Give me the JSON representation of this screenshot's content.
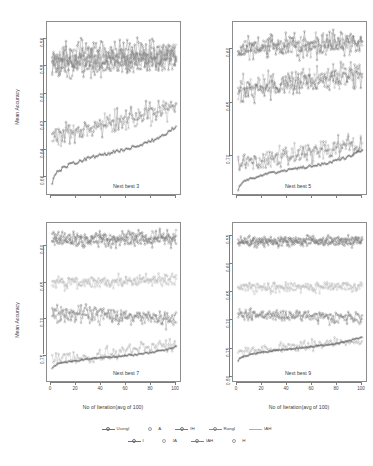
{
  "figure": {
    "y_axis_title": "Mean Accuracy",
    "x_axis_title": "No of Iteration(avg of 100)",
    "background": "#ffffff"
  },
  "panels": [
    {
      "id": "next-best-3",
      "title": "Next best 3",
      "yticks": [
        "0.66",
        "0.64",
        "0.62",
        "0.60",
        "0.58",
        "0.56"
      ],
      "xticks": [],
      "ylim": [
        0.548,
        0.672
      ],
      "xlim": [
        0,
        100
      ]
    },
    {
      "id": "next-best-5",
      "title": "Next best 5",
      "yticks": [
        "0.70",
        "0.65",
        "0.60"
      ],
      "xticks": [],
      "ylim": [
        0.565,
        0.725
      ],
      "xlim": [
        0,
        100
      ]
    },
    {
      "id": "next-best-7",
      "title": "Next best 7",
      "yticks": [
        "0.75",
        "0.70",
        "0.65",
        "0.60"
      ],
      "xticks": [
        "0",
        "20",
        "40",
        "60",
        "80",
        "100"
      ],
      "ylim": [
        0.565,
        0.782
      ],
      "xlim": [
        0,
        100
      ]
    },
    {
      "id": "next-best-9",
      "title": "Next best 9",
      "yticks": [
        "0.80",
        "0.75",
        "0.70",
        "0.65",
        "0.60",
        "0.55"
      ],
      "xticks": [
        "0",
        "20",
        "40",
        "60",
        "80",
        "100"
      ],
      "ylim": [
        0.543,
        0.822
      ],
      "xlim": [
        0,
        100
      ]
    }
  ],
  "legend": {
    "rows": [
      [
        {
          "label": "Usergl",
          "color": "#6f6f6f",
          "marker": "circle",
          "line": true
        },
        {
          "label": "A",
          "color": "#9a9a9a",
          "marker": "circle",
          "line": false
        },
        {
          "label": "IH",
          "color": "#7a7a7a",
          "marker": "circle",
          "line": true
        },
        {
          "label": "Rangl",
          "color": "#8a8a8a",
          "marker": "circle",
          "line": true
        },
        {
          "label": "IAH",
          "color": "#b0b0b0",
          "marker": "none",
          "line": true
        }
      ],
      [
        {
          "label": "I",
          "color": "#707070",
          "marker": "circle",
          "line": true
        },
        {
          "label": "IA",
          "color": "#a5a5a5",
          "marker": "circle",
          "line": false
        },
        {
          "label": "IAH",
          "color": "#7f7f7f",
          "marker": "circle",
          "line": true
        },
        {
          "label": "H",
          "color": "#9c9c9c",
          "marker": "circle",
          "line": false
        }
      ]
    ]
  },
  "chart_data": {
    "type": "line",
    "title": "",
    "xlabel": "No of Iteration(avg of 100)",
    "ylabel": "Mean Accuracy",
    "grid": false,
    "legend_position": "bottom",
    "panel_layout": "2x2",
    "x": [
      1,
      100
    ],
    "panels": [
      {
        "title": "Next best 3",
        "ylim": [
          0.548,
          0.672
        ],
        "xlim": [
          0,
          100
        ],
        "yticks": [
          0.56,
          0.58,
          0.6,
          0.62,
          0.64,
          0.66
        ],
        "xticks": [
          0,
          20,
          40,
          60,
          80,
          100
        ],
        "series": [
          {
            "name": "Usergl",
            "color": "#6f6f6f",
            "band_mean": 0.65,
            "band_noise": 0.01,
            "trend_start": 0.648,
            "trend_end": 0.652,
            "style": "noisy"
          },
          {
            "name": "A",
            "color": "#9a9a9a",
            "band_mean": 0.646,
            "band_noise": 0.009,
            "trend_start": 0.644,
            "trend_end": 0.649,
            "style": "noisy"
          },
          {
            "name": "IH",
            "color": "#7a7a7a",
            "band_mean": 0.643,
            "band_noise": 0.009,
            "trend_start": 0.641,
            "trend_end": 0.646,
            "style": "noisy"
          },
          {
            "name": "Rangl",
            "color": "#8a8a8a",
            "band_mean": 0.64,
            "band_noise": 0.008,
            "trend_start": 0.638,
            "trend_end": 0.643,
            "style": "noisy"
          },
          {
            "name": "IAH",
            "color": "#b0b0b0",
            "band_mean": 0.648,
            "band_noise": 0.009,
            "trend_start": 0.646,
            "trend_end": 0.65,
            "style": "noisy"
          },
          {
            "name": "I",
            "color": "#707070",
            "band_mean": 0.599,
            "band_noise": 0.008,
            "trend_start": 0.59,
            "trend_end": 0.611,
            "style": "noisy"
          },
          {
            "name": "IA",
            "color": "#a5a5a5",
            "band_mean": 0.598,
            "band_noise": 0.008,
            "trend_start": 0.589,
            "trend_end": 0.61,
            "style": "noisy"
          },
          {
            "name": "IAH2",
            "color": "#7f7f7f",
            "band_mean": 0.645,
            "band_noise": 0.009,
            "trend_start": 0.643,
            "trend_end": 0.648,
            "style": "noisy"
          },
          {
            "name": "H",
            "color": "#6a6a6a",
            "band_mean": 0.575,
            "band_noise": 0.0015,
            "trend_start": 0.556,
            "trend_end": 0.597,
            "style": "monotone"
          }
        ]
      },
      {
        "title": "Next best 5",
        "ylim": [
          0.565,
          0.725
        ],
        "xlim": [
          0,
          100
        ],
        "yticks": [
          0.6,
          0.65,
          0.7
        ],
        "xticks": [
          0,
          20,
          40,
          60,
          80,
          100
        ],
        "series": [
          {
            "name": "Usergl",
            "color": "#6f6f6f",
            "band_mean": 0.705,
            "band_noise": 0.011,
            "trend_start": 0.702,
            "trend_end": 0.709,
            "style": "noisy"
          },
          {
            "name": "A",
            "color": "#9a9a9a",
            "band_mean": 0.703,
            "band_noise": 0.01,
            "trend_start": 0.7,
            "trend_end": 0.707,
            "style": "noisy"
          },
          {
            "name": "IH",
            "color": "#7a7a7a",
            "band_mean": 0.7,
            "band_noise": 0.01,
            "trend_start": 0.698,
            "trend_end": 0.704,
            "style": "noisy"
          },
          {
            "name": "Rangl",
            "color": "#8a8a8a",
            "band_mean": 0.671,
            "band_noise": 0.012,
            "trend_start": 0.665,
            "trend_end": 0.679,
            "style": "noisy"
          },
          {
            "name": "IAH",
            "color": "#b0b0b0",
            "band_mean": 0.668,
            "band_noise": 0.011,
            "trend_start": 0.662,
            "trend_end": 0.676,
            "style": "noisy"
          },
          {
            "name": "I",
            "color": "#707070",
            "band_mean": 0.666,
            "band_noise": 0.011,
            "trend_start": 0.66,
            "trend_end": 0.674,
            "style": "noisy"
          },
          {
            "name": "IA",
            "color": "#a5a5a5",
            "band_mean": 0.602,
            "band_noise": 0.009,
            "trend_start": 0.594,
            "trend_end": 0.613,
            "style": "noisy"
          },
          {
            "name": "IAH2",
            "color": "#7f7f7f",
            "band_mean": 0.6,
            "band_noise": 0.009,
            "trend_start": 0.592,
            "trend_end": 0.612,
            "style": "noisy"
          },
          {
            "name": "H",
            "color": "#6a6a6a",
            "band_mean": 0.586,
            "band_noise": 0.0015,
            "trend_start": 0.569,
            "trend_end": 0.606,
            "style": "monotone"
          }
        ]
      },
      {
        "title": "Next best 7",
        "ylim": [
          0.565,
          0.782
        ],
        "xlim": [
          0,
          100
        ],
        "yticks": [
          0.6,
          0.65,
          0.7,
          0.75
        ],
        "xticks": [
          0,
          20,
          40,
          60,
          80,
          100
        ],
        "series": [
          {
            "name": "Usergl",
            "color": "#6f6f6f",
            "band_mean": 0.763,
            "band_noise": 0.01,
            "trend_start": 0.761,
            "trend_end": 0.765,
            "style": "noisy"
          },
          {
            "name": "A",
            "color": "#9a9a9a",
            "band_mean": 0.76,
            "band_noise": 0.009,
            "trend_start": 0.758,
            "trend_end": 0.763,
            "style": "noisy"
          },
          {
            "name": "IH",
            "color": "#7a7a7a",
            "band_mean": 0.757,
            "band_noise": 0.009,
            "trend_start": 0.755,
            "trend_end": 0.76,
            "style": "noisy"
          },
          {
            "name": "Rangl",
            "color": "#b0b0b0",
            "band_mean": 0.703,
            "band_noise": 0.008,
            "trend_start": 0.701,
            "trend_end": 0.706,
            "style": "noisy"
          },
          {
            "name": "IAH",
            "color": "#bdbdbd",
            "band_mean": 0.7,
            "band_noise": 0.008,
            "trend_start": 0.698,
            "trend_end": 0.703,
            "style": "noisy"
          },
          {
            "name": "I",
            "color": "#707070",
            "band_mean": 0.655,
            "band_noise": 0.011,
            "trend_start": 0.659,
            "trend_end": 0.653,
            "style": "noisy"
          },
          {
            "name": "IA",
            "color": "#8f8f8f",
            "band_mean": 0.652,
            "band_noise": 0.011,
            "trend_start": 0.656,
            "trend_end": 0.65,
            "style": "noisy"
          },
          {
            "name": "IAH2",
            "color": "#a5a5a5",
            "band_mean": 0.602,
            "band_noise": 0.01,
            "trend_start": 0.592,
            "trend_end": 0.617,
            "style": "noisy"
          },
          {
            "name": "H",
            "color": "#6a6a6a",
            "band_mean": 0.592,
            "band_noise": 0.0015,
            "trend_start": 0.582,
            "trend_end": 0.612,
            "style": "monotone"
          }
        ]
      },
      {
        "title": "Next best 9",
        "ylim": [
          0.543,
          0.822
        ],
        "xlim": [
          0,
          100
        ],
        "yticks": [
          0.55,
          0.6,
          0.65,
          0.7,
          0.75,
          0.8
        ],
        "xticks": [
          0,
          20,
          40,
          60,
          80,
          100
        ],
        "series": [
          {
            "name": "Usergl",
            "color": "#6f6f6f",
            "band_mean": 0.792,
            "band_noise": 0.008,
            "trend_start": 0.791,
            "trend_end": 0.793,
            "style": "noisy"
          },
          {
            "name": "A",
            "color": "#8a8a8a",
            "band_mean": 0.789,
            "band_noise": 0.008,
            "trend_start": 0.788,
            "trend_end": 0.791,
            "style": "noisy"
          },
          {
            "name": "IH",
            "color": "#7a7a7a",
            "band_mean": 0.787,
            "band_noise": 0.008,
            "trend_start": 0.786,
            "trend_end": 0.789,
            "style": "noisy"
          },
          {
            "name": "Rangl",
            "color": "#b3b3b3",
            "band_mean": 0.71,
            "band_noise": 0.009,
            "trend_start": 0.709,
            "trend_end": 0.712,
            "style": "noisy"
          },
          {
            "name": "IAH",
            "color": "#c0c0c0",
            "band_mean": 0.707,
            "band_noise": 0.009,
            "trend_start": 0.706,
            "trend_end": 0.709,
            "style": "noisy"
          },
          {
            "name": "I",
            "color": "#707070",
            "band_mean": 0.659,
            "band_noise": 0.01,
            "trend_start": 0.662,
            "trend_end": 0.656,
            "style": "noisy"
          },
          {
            "name": "IA",
            "color": "#909090",
            "band_mean": 0.656,
            "band_noise": 0.01,
            "trend_start": 0.659,
            "trend_end": 0.653,
            "style": "noisy"
          },
          {
            "name": "IAH2",
            "color": "#a8a8a8",
            "band_mean": 0.603,
            "band_noise": 0.009,
            "trend_start": 0.596,
            "trend_end": 0.614,
            "style": "noisy"
          },
          {
            "name": "H",
            "color": "#6a6a6a",
            "band_mean": 0.598,
            "band_noise": 0.0015,
            "trend_start": 0.578,
            "trend_end": 0.621,
            "style": "monotone"
          }
        ]
      }
    ]
  }
}
